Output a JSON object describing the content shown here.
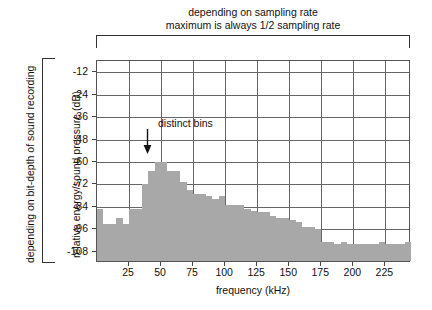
{
  "figure": {
    "top_caption_line1": "depending on sampling rate",
    "top_caption_line2": "maximum is always 1/2 sampling rate",
    "left_bracket_label": "depending on bit-depth of sound recording",
    "annotation_label": "distinct bins"
  },
  "chart_data": {
    "type": "bar",
    "title": "",
    "xlabel": "frequency (kHz)",
    "ylabel": "relative energy/sound pressure (dB)",
    "xlim": [
      0,
      245
    ],
    "ylim": [
      -114,
      -6
    ],
    "grid": true,
    "legend": "none",
    "bin_width_khz": 5,
    "xticks": [
      25,
      50,
      75,
      100,
      125,
      150,
      175,
      200,
      225
    ],
    "yticks": [
      -12,
      -24,
      -36,
      -48,
      -60,
      -72,
      -84,
      -96,
      -108
    ],
    "bar_color": "#a8a8a8",
    "annotations": [
      {
        "text": "distinct bins",
        "x": 40,
        "y": -48,
        "arrow_to_x": 40,
        "arrow_to_y": -56
      }
    ],
    "x": [
      2.5,
      7.5,
      12.5,
      17.5,
      22.5,
      27.5,
      32.5,
      37.5,
      42.5,
      47.5,
      52.5,
      57.5,
      62.5,
      67.5,
      72.5,
      77.5,
      82.5,
      87.5,
      92.5,
      97.5,
      102.5,
      107.5,
      112.5,
      117.5,
      122.5,
      127.5,
      132.5,
      137.5,
      142.5,
      147.5,
      152.5,
      157.5,
      162.5,
      167.5,
      172.5,
      177.5,
      182.5,
      187.5,
      192.5,
      197.5,
      202.5,
      207.5,
      212.5,
      217.5,
      222.5,
      227.5,
      232.5,
      237.5,
      242.5
    ],
    "values": [
      -86,
      -94,
      -94,
      -91,
      -94,
      -86,
      -86,
      -73,
      -66,
      -61,
      -61,
      -66,
      -66,
      -72,
      -76,
      -78,
      -78,
      -79,
      -81,
      -79,
      -84,
      -84,
      -84,
      -86,
      -87,
      -88,
      -88,
      -90,
      -91,
      -91,
      -92,
      -93,
      -96,
      -96,
      -97,
      -104,
      -104,
      -105,
      -104,
      -105,
      -105,
      -105,
      -105,
      -105,
      -104,
      -105,
      -105,
      -105,
      -104
    ]
  }
}
